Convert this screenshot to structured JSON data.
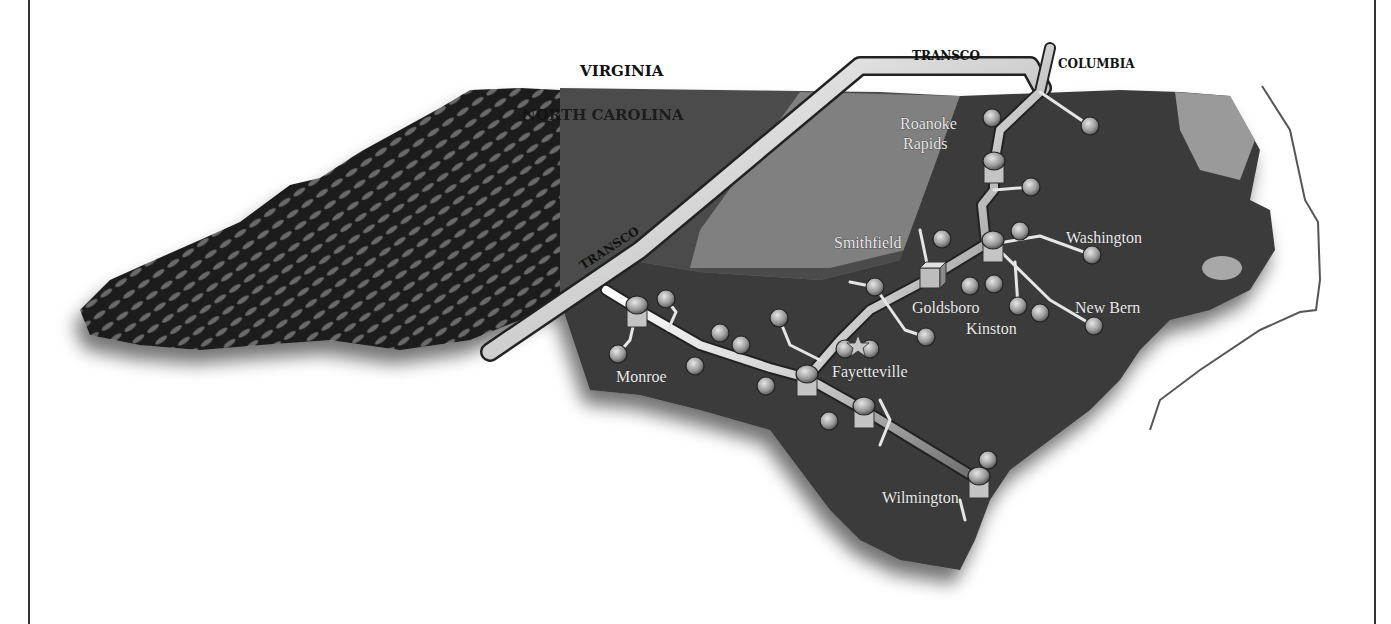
{
  "map": {
    "title": "North Carolina Natural Gas Pipeline Map",
    "colors": {
      "background": "#ffffff",
      "frame": "#333333",
      "mountains": "#1c1c1c",
      "piedmont": "#4a4a4a",
      "piedmont_light": "#8c8c8c",
      "coastal_plain": "#3a3a3a",
      "sound_water": "#9a9a9a",
      "pipe_highlight": "#f2f2f2",
      "pipe_shadow": "#555555",
      "node_fill": "#9a9a9a",
      "label_dark": "#111111",
      "label_light": "#eaeaea"
    },
    "state_labels": [
      {
        "id": "virginia",
        "text": "VIRGINIA",
        "x": 580,
        "y": 76
      },
      {
        "id": "north-carolina",
        "text": "NORTH CAROLINA",
        "x": 522,
        "y": 120
      }
    ],
    "pipeline_labels": [
      {
        "id": "transco-top",
        "text": "TRANSCO",
        "x": 912,
        "y": 60
      },
      {
        "id": "columbia",
        "text": "COLUMBIA",
        "x": 1058,
        "y": 68
      },
      {
        "id": "transco-diagonal",
        "text": "TRANSCO",
        "x": 583,
        "y": 270,
        "rotate": -33
      }
    ],
    "city_labels": [
      {
        "id": "roanoke-rapids-1",
        "text": "Roanoke",
        "x": 900,
        "y": 129
      },
      {
        "id": "roanoke-rapids-2",
        "text": "Rapids",
        "x": 903,
        "y": 149
      },
      {
        "id": "smithfield",
        "text": "Smithfield",
        "x": 834,
        "y": 248
      },
      {
        "id": "washington",
        "text": "Washington",
        "x": 1066,
        "y": 243
      },
      {
        "id": "goldsboro",
        "text": "Goldsboro",
        "x": 912,
        "y": 313
      },
      {
        "id": "kinston",
        "text": "Kinston",
        "x": 966,
        "y": 334
      },
      {
        "id": "new-bern",
        "text": "New Bern",
        "x": 1075,
        "y": 313
      },
      {
        "id": "monroe",
        "text": "Monroe",
        "x": 616,
        "y": 382
      },
      {
        "id": "fayetteville",
        "text": "Fayetteville",
        "x": 832,
        "y": 377
      },
      {
        "id": "wilmington",
        "text": "Wilmington",
        "x": 882,
        "y": 503
      }
    ],
    "nodes": [
      {
        "x": 992,
        "y": 118
      },
      {
        "x": 1090,
        "y": 126
      },
      {
        "x": 1031,
        "y": 187
      },
      {
        "x": 942,
        "y": 239
      },
      {
        "x": 1020,
        "y": 231
      },
      {
        "x": 1092,
        "y": 255
      },
      {
        "x": 875,
        "y": 287
      },
      {
        "x": 970,
        "y": 286
      },
      {
        "x": 994,
        "y": 284
      },
      {
        "x": 1018,
        "y": 306
      },
      {
        "x": 1040,
        "y": 313
      },
      {
        "x": 1094,
        "y": 326
      },
      {
        "x": 926,
        "y": 337
      },
      {
        "x": 666,
        "y": 299
      },
      {
        "x": 720,
        "y": 333
      },
      {
        "x": 741,
        "y": 345
      },
      {
        "x": 618,
        "y": 354
      },
      {
        "x": 695,
        "y": 366
      },
      {
        "x": 779,
        "y": 318
      },
      {
        "x": 845,
        "y": 349
      },
      {
        "x": 870,
        "y": 349
      },
      {
        "x": 766,
        "y": 386
      },
      {
        "x": 829,
        "y": 421
      },
      {
        "x": 988,
        "y": 460
      }
    ],
    "compressor_stations": [
      {
        "x": 637,
        "y": 309
      },
      {
        "x": 994,
        "y": 165
      },
      {
        "x": 993,
        "y": 244
      },
      {
        "x": 807,
        "y": 378
      },
      {
        "x": 864,
        "y": 410
      },
      {
        "x": 979,
        "y": 480
      }
    ],
    "marker_star": {
      "x": 858,
      "y": 345,
      "label": "star-marker"
    },
    "junction_box": {
      "x": 930,
      "y": 278
    }
  }
}
